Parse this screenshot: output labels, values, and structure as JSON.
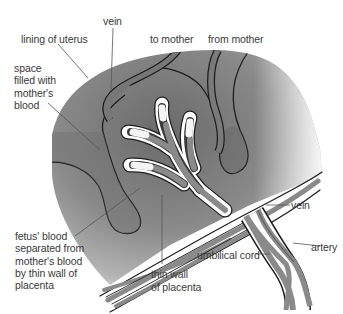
{
  "diagram": {
    "subject": "placenta",
    "colors": {
      "background": "#ffffff",
      "maternal_blood_dark": "#6e6e6e",
      "maternal_blood_light": "#b5b5b5",
      "fetal_vessel": "#8a8a8a",
      "vessel_wall": "#ffffff",
      "outline": "#1e1e1e",
      "leader_line": "#555555",
      "label_text": "#3a3a3a"
    },
    "labels": {
      "vein_top": "vein",
      "lining_of_uterus": "lining of uterus",
      "to_mother": "to mother",
      "from_mother": "from mother",
      "space_filled": "space\nfilled with\nmother's\nblood",
      "fetus_blood": "fetus' blood\nseparated from\nmother's blood\nby thin wall of\nplacenta",
      "thin_wall": "thin wall\nof placenta",
      "vein_right": "vein",
      "artery": "artery",
      "umbilical_cord": "umbilical cord"
    }
  }
}
